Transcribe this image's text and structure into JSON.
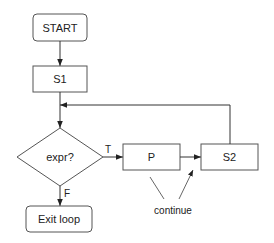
{
  "diagram": {
    "type": "flowchart",
    "nodes": [
      {
        "id": "start",
        "shape": "rounded-rect",
        "label": "START"
      },
      {
        "id": "s1",
        "shape": "rect",
        "label": "S1"
      },
      {
        "id": "cond",
        "shape": "diamond",
        "label": "expr?"
      },
      {
        "id": "p",
        "shape": "rect",
        "label": "P"
      },
      {
        "id": "s2",
        "shape": "rect",
        "label": "S2"
      },
      {
        "id": "exit",
        "shape": "rounded-rect",
        "label": "Exit loop"
      }
    ],
    "edges": [
      {
        "from": "start",
        "to": "s1",
        "label": ""
      },
      {
        "from": "s1",
        "to": "cond",
        "label": ""
      },
      {
        "from": "cond",
        "to": "p",
        "label": "T"
      },
      {
        "from": "cond",
        "to": "exit",
        "label": "F"
      },
      {
        "from": "p",
        "to": "s2",
        "label": ""
      },
      {
        "from": "s2",
        "to": "cond",
        "label": "loop back"
      }
    ],
    "annotation": "continue"
  }
}
